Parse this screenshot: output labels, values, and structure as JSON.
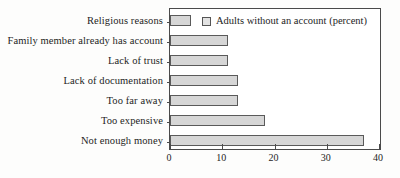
{
  "chart_data": {
    "type": "bar",
    "orientation": "horizontal",
    "title": "",
    "xlabel": "",
    "ylabel": "",
    "xlim": [
      0,
      40
    ],
    "xticks": [
      0,
      10,
      20,
      30,
      40
    ],
    "grid": false,
    "legend_position": "top-left-inside",
    "legend": [
      "Adults without an account (percent)"
    ],
    "categories": [
      "Religious reasons",
      "Family member already has account",
      "Lack of  trust",
      "Lack of documentation",
      "Too far away",
      "Too expensive",
      "Not enough money"
    ],
    "values": [
      4,
      11,
      11,
      13,
      13,
      18,
      37
    ],
    "series": [
      {
        "name": "Adults without an account (percent)",
        "values": [
          4,
          11,
          11,
          13,
          13,
          18,
          37
        ]
      }
    ],
    "colors": {
      "bar_fill": "#d6d6d6",
      "bar_border": "#5a5a5a",
      "axis": "#4a4a4a",
      "text": "#1d1d1d",
      "background": "#fdfdfc"
    }
  }
}
